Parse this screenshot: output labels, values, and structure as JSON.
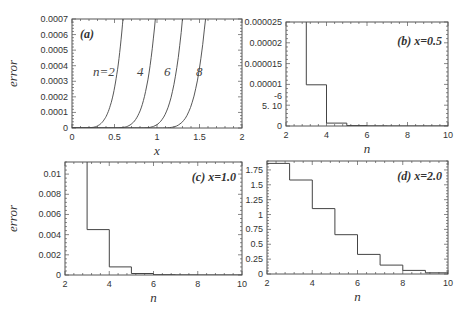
{
  "chart_data": [
    {
      "id": "a",
      "type": "line",
      "panel_label": "(a)",
      "xlabel": "x",
      "ylabel": "error",
      "xlim": [
        0,
        2
      ],
      "ylim": [
        0,
        0.0007
      ],
      "xticks": [
        "0",
        "0.5",
        "1",
        "1.5",
        "2"
      ],
      "yticks": [
        "0",
        "0.0001",
        "0.0002",
        "0.0003",
        "0.0004",
        "0.0005",
        "0.0006",
        "0.0007"
      ],
      "series": [
        {
          "name": "n=2",
          "label": "n=2",
          "onset_x": 0.3,
          "x_at_top": 0.6
        },
        {
          "name": "n=4",
          "label": "4",
          "onset_x": 0.65,
          "x_at_top": 0.98
        },
        {
          "name": "n=6",
          "label": "6",
          "onset_x": 0.95,
          "x_at_top": 1.3
        },
        {
          "name": "n=8",
          "label": "8",
          "onset_x": 1.2,
          "x_at_top": 1.57
        }
      ]
    },
    {
      "id": "b",
      "type": "line",
      "panel_label": "(b) x=0.5",
      "xlabel": "n",
      "ylabel": "",
      "xlim": [
        2,
        10
      ],
      "ylim": [
        0,
        2.5e-05
      ],
      "xticks": [
        "2",
        "4",
        "6",
        "8",
        "10"
      ],
      "yticks": [
        "0",
        "5. 10^-6",
        "0.00001",
        "0.000015",
        "0.00002",
        "0.000025"
      ],
      "step": true,
      "x": [
        3,
        4,
        5,
        6,
        7,
        8,
        9,
        10
      ],
      "values": [
        9.9e-06,
        7e-07,
        1e-07,
        2e-08,
        0.0,
        0.0,
        0.0,
        0.0
      ],
      "note": "value at n=2 exceeds plot range"
    },
    {
      "id": "c",
      "type": "line",
      "panel_label": "(c) x=1.0",
      "xlabel": "n",
      "ylabel": "error",
      "xlim": [
        2,
        10
      ],
      "ylim": [
        0,
        0.0112
      ],
      "xticks": [
        "2",
        "4",
        "6",
        "8",
        "10"
      ],
      "yticks": [
        "0",
        "0.002",
        "0.004",
        "0.006",
        "0.008",
        "0.01"
      ],
      "step": true,
      "x": [
        3,
        4,
        5,
        6,
        7,
        8,
        9,
        10
      ],
      "values": [
        0.0045,
        0.0008,
        0.00015,
        3e-05,
        5e-06,
        0.0,
        0.0,
        0.0
      ],
      "note": "value at n=2 exceeds plot range"
    },
    {
      "id": "d",
      "type": "line",
      "panel_label": "(d) x=2.0",
      "xlabel": "n",
      "ylabel": "",
      "xlim": [
        2,
        10
      ],
      "ylim": [
        0,
        1.9
      ],
      "xticks": [
        "2",
        "4",
        "6",
        "8",
        "10"
      ],
      "yticks": [
        "0",
        "0.25",
        "0.5",
        "0.75",
        "1",
        "1.25",
        "1.5",
        "1.75"
      ],
      "step": true,
      "x": [
        2,
        3,
        4,
        5,
        6,
        7,
        8,
        9,
        10
      ],
      "values": [
        1.86,
        1.58,
        1.1,
        0.66,
        0.33,
        0.15,
        0.06,
        0.02,
        0.0
      ]
    }
  ]
}
